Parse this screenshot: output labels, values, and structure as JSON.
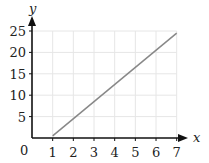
{
  "chart_data": {
    "type": "line",
    "title": "",
    "xlabel": "x",
    "ylabel": "y",
    "xlim": [
      0,
      7
    ],
    "ylim": [
      0,
      25
    ],
    "grid": true,
    "legend": null,
    "x_ticks": [
      "1",
      "2",
      "3",
      "4",
      "5",
      "6",
      "7"
    ],
    "y_ticks": [
      "5",
      "10",
      "15",
      "20",
      "25"
    ],
    "origin_label": "0",
    "series": [
      {
        "name": "line",
        "color": "#888888",
        "x": [
          1,
          7
        ],
        "y": [
          0.5,
          24.5
        ]
      }
    ]
  },
  "colors": {
    "axis": "#111111",
    "grid": "#e6e6e6",
    "line": "#888888"
  }
}
